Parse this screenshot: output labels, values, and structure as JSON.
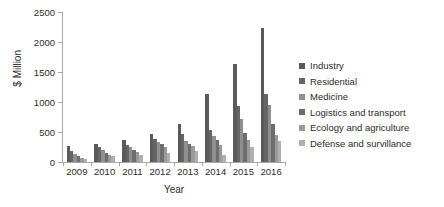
{
  "chart_data": {
    "type": "bar",
    "title": "",
    "xlabel": "Year",
    "ylabel": "$ Million",
    "ylim": [
      0,
      2500
    ],
    "yticks": [
      0,
      500,
      1000,
      1500,
      2000,
      2500
    ],
    "ytick_labels": [
      "0",
      "500",
      "1000",
      "1500",
      "2000",
      "2500"
    ],
    "grid": false,
    "legend_position": "right",
    "categories": [
      "2009",
      "2010",
      "2011",
      "2012",
      "2013",
      "2014",
      "2015",
      "2016"
    ],
    "series": [
      {
        "name": "Industry",
        "color": "#5a5a5a",
        "values": [
          260,
          305,
          360,
          465,
          630,
          1130,
          1640,
          2230
        ]
      },
      {
        "name": "Residential",
        "color": "#656565",
        "values": [
          185,
          255,
          285,
          390,
          470,
          530,
          935,
          1140
        ]
      },
      {
        "name": "Medicine",
        "color": "#8f8f8f",
        "values": [
          140,
          200,
          250,
          330,
          345,
          440,
          725,
          945
        ]
      },
      {
        "name": "Logistics and transport",
        "color": "#6e6e6e",
        "values": [
          95,
          150,
          200,
          300,
          305,
          360,
          490,
          640
        ]
      },
      {
        "name": "Ecology and agriculture",
        "color": "#9a9a9a",
        "values": [
          65,
          120,
          160,
          255,
          265,
          280,
          375,
          450
        ]
      },
      {
        "name": "Defense and survillance",
        "color": "#b0b0b0",
        "values": [
          50,
          95,
          120,
          150,
          190,
          110,
          250,
          345
        ]
      }
    ]
  }
}
